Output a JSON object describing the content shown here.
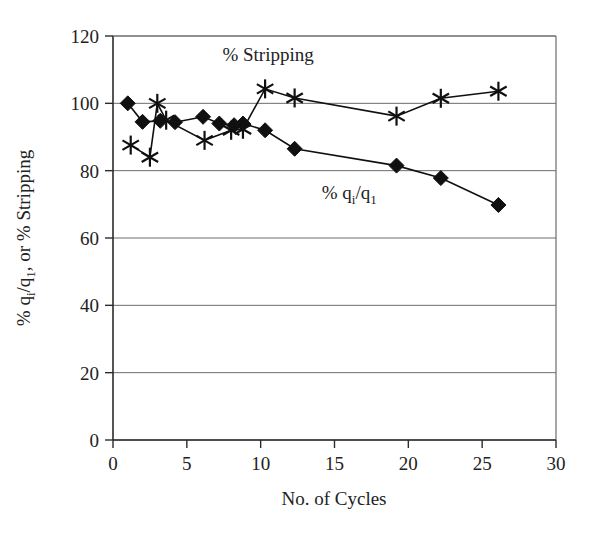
{
  "chart_data": {
    "type": "line",
    "title": "",
    "xlabel": "No. of Cycles",
    "ylabel": "% qᵢ/q₁, or % Stripping",
    "ylabel_parts": {
      "prefix": "% q",
      "sub1": "i",
      "mid": "/q",
      "sub2": "1",
      "suffix": ", or % Stripping"
    },
    "xlim": [
      0,
      30
    ],
    "ylim": [
      0,
      120
    ],
    "xticks": [
      0,
      5,
      10,
      15,
      20,
      25,
      30
    ],
    "yticks": [
      0,
      20,
      40,
      60,
      80,
      100,
      120
    ],
    "xtick_labels": [
      "0",
      "5",
      "10",
      "15",
      "20",
      "25",
      "30"
    ],
    "ytick_labels": [
      "0",
      "20",
      "40",
      "60",
      "80",
      "100",
      "120"
    ],
    "grid": "horizontal",
    "legend_position": "inline-annotation",
    "series": [
      {
        "name": "% Stripping",
        "marker": "asterisk",
        "annotation": "% Stripping",
        "annotation_x": 10.5,
        "annotation_y": 112.5,
        "points": [
          {
            "x": 1.2,
            "y": 87.6
          },
          {
            "x": 2.5,
            "y": 84.0
          },
          {
            "x": 3.0,
            "y": 100.0
          },
          {
            "x": 3.6,
            "y": 95.0
          },
          {
            "x": 6.2,
            "y": 89.0
          },
          {
            "x": 8.0,
            "y": 92.0
          },
          {
            "x": 8.8,
            "y": 92.3
          },
          {
            "x": 10.3,
            "y": 104.3
          },
          {
            "x": 12.3,
            "y": 101.6
          },
          {
            "x": 19.2,
            "y": 96.2
          },
          {
            "x": 22.2,
            "y": 101.5
          },
          {
            "x": 26.1,
            "y": 103.6
          }
        ]
      },
      {
        "name": "% qi/q1",
        "marker": "diamond",
        "annotation": "% qᵢ/q₁",
        "annotation_parts": {
          "prefix": "% q",
          "sub1": "i",
          "mid": "/q",
          "sub2": "1"
        },
        "annotation_x": 16.0,
        "annotation_y": 71.5,
        "points": [
          {
            "x": 1.0,
            "y": 100.0
          },
          {
            "x": 2.0,
            "y": 94.5
          },
          {
            "x": 3.2,
            "y": 94.8
          },
          {
            "x": 4.2,
            "y": 94.4
          },
          {
            "x": 6.1,
            "y": 96.0
          },
          {
            "x": 7.2,
            "y": 94.0
          },
          {
            "x": 8.2,
            "y": 93.5
          },
          {
            "x": 8.8,
            "y": 94.0
          },
          {
            "x": 10.3,
            "y": 92.0
          },
          {
            "x": 12.3,
            "y": 86.5
          },
          {
            "x": 19.2,
            "y": 81.5
          },
          {
            "x": 22.2,
            "y": 77.8
          },
          {
            "x": 26.1,
            "y": 69.8
          }
        ]
      }
    ],
    "colors": {
      "series_line": "#101010",
      "marker": "#101010",
      "grid": "#6d6d6d",
      "axis": "#2b2b2b",
      "background": "#ffffff"
    }
  }
}
